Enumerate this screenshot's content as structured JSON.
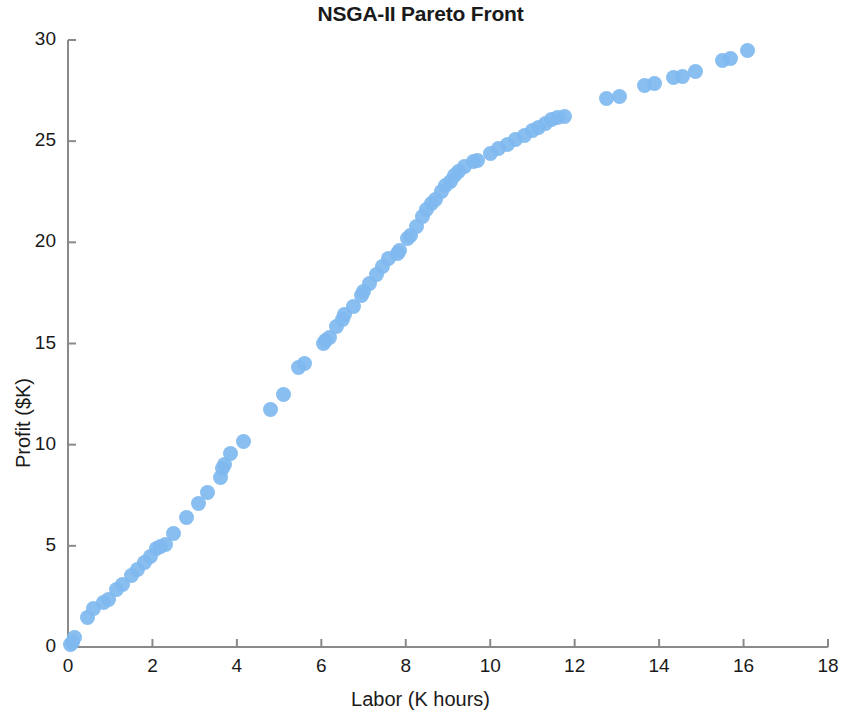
{
  "chart_data": {
    "type": "scatter",
    "title": "NSGA-II Pareto Front",
    "xlabel": "Labor (K hours)",
    "ylabel": "Profit ($K)",
    "xlim": [
      0,
      18
    ],
    "ylim": [
      0,
      30
    ],
    "xticks": [
      0,
      2,
      4,
      6,
      8,
      10,
      12,
      14,
      16,
      18
    ],
    "yticks": [
      0,
      5,
      10,
      15,
      20,
      25,
      30
    ],
    "grid": false,
    "legend": null,
    "marker": {
      "shape": "circle",
      "color": "#7fb8ef",
      "size": 15,
      "edge": "none"
    },
    "series": [
      {
        "name": "Pareto front",
        "points": [
          [
            0.05,
            0.1
          ],
          [
            0.1,
            0.2
          ],
          [
            0.15,
            0.45
          ],
          [
            0.45,
            1.45
          ],
          [
            0.6,
            1.9
          ],
          [
            0.85,
            2.2
          ],
          [
            0.95,
            2.35
          ],
          [
            1.15,
            2.85
          ],
          [
            1.3,
            3.1
          ],
          [
            1.5,
            3.55
          ],
          [
            1.65,
            3.85
          ],
          [
            1.8,
            4.2
          ],
          [
            1.95,
            4.45
          ],
          [
            2.1,
            4.85
          ],
          [
            2.2,
            4.95
          ],
          [
            2.3,
            5.05
          ],
          [
            2.5,
            5.6
          ],
          [
            2.8,
            6.4
          ],
          [
            3.1,
            7.1
          ],
          [
            3.3,
            7.65
          ],
          [
            3.6,
            8.4
          ],
          [
            3.65,
            8.8
          ],
          [
            3.7,
            9.0
          ],
          [
            3.85,
            9.55
          ],
          [
            4.15,
            10.15
          ],
          [
            4.8,
            11.75
          ],
          [
            5.1,
            12.5
          ],
          [
            5.45,
            13.8
          ],
          [
            5.6,
            14.0
          ],
          [
            6.05,
            15.0
          ],
          [
            6.1,
            15.15
          ],
          [
            6.2,
            15.3
          ],
          [
            6.35,
            15.85
          ],
          [
            6.5,
            16.2
          ],
          [
            6.55,
            16.45
          ],
          [
            6.75,
            16.85
          ],
          [
            6.95,
            17.35
          ],
          [
            7.0,
            17.55
          ],
          [
            7.15,
            17.95
          ],
          [
            7.3,
            18.4
          ],
          [
            7.45,
            18.8
          ],
          [
            7.6,
            19.2
          ],
          [
            7.8,
            19.45
          ],
          [
            7.85,
            19.6
          ],
          [
            8.05,
            20.2
          ],
          [
            8.1,
            20.35
          ],
          [
            8.25,
            20.8
          ],
          [
            8.4,
            21.3
          ],
          [
            8.5,
            21.6
          ],
          [
            8.6,
            21.9
          ],
          [
            8.7,
            22.1
          ],
          [
            8.85,
            22.5
          ],
          [
            8.95,
            22.8
          ],
          [
            9.05,
            23.0
          ],
          [
            9.15,
            23.3
          ],
          [
            9.25,
            23.5
          ],
          [
            9.4,
            23.75
          ],
          [
            9.6,
            24.0
          ],
          [
            9.7,
            24.05
          ],
          [
            10.0,
            24.4
          ],
          [
            10.2,
            24.65
          ],
          [
            10.4,
            24.85
          ],
          [
            10.6,
            25.1
          ],
          [
            10.8,
            25.3
          ],
          [
            11.0,
            25.55
          ],
          [
            11.15,
            25.7
          ],
          [
            11.3,
            25.85
          ],
          [
            11.45,
            26.05
          ],
          [
            11.6,
            26.15
          ],
          [
            11.75,
            26.2
          ],
          [
            12.75,
            27.1
          ],
          [
            13.05,
            27.2
          ],
          [
            13.65,
            27.75
          ],
          [
            13.9,
            27.85
          ],
          [
            14.35,
            28.15
          ],
          [
            14.55,
            28.2
          ],
          [
            14.85,
            28.45
          ],
          [
            15.5,
            29.0
          ],
          [
            15.7,
            29.1
          ],
          [
            16.1,
            29.5
          ]
        ]
      }
    ]
  }
}
